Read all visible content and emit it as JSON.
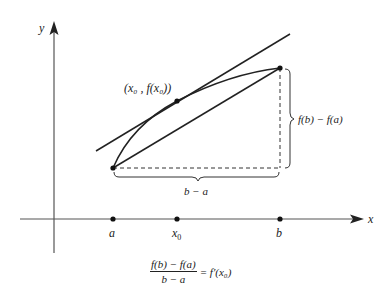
{
  "diagram": {
    "axes": {
      "x_label": "x",
      "y_label": "y"
    },
    "points_on_x_axis": [
      {
        "id": "a",
        "label": "a",
        "x": 113
      },
      {
        "id": "x0",
        "label": "x",
        "sub": "0",
        "x": 177
      },
      {
        "id": "b",
        "label": "b",
        "x": 280
      }
    ],
    "tangent_point_label": "(x₀ , f(x₀))",
    "vertical_brace_label": "f(b) − f(a)",
    "horizontal_brace_label": "b − a",
    "formula": {
      "numerator": "f(b) − f(a)",
      "denominator": "b − a",
      "rhs": "= f′(x₀)"
    },
    "colors": {
      "ink": "#222222",
      "axis": "#555555",
      "background": "#ffffff"
    }
  }
}
